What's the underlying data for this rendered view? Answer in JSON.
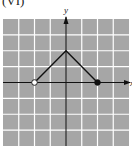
{
  "title": "(VI)",
  "chart_data": {
    "type": "line",
    "title": "(VI)",
    "xlabel": "x",
    "ylabel": "y",
    "xlim": [
      -4,
      4
    ],
    "ylim": [
      -4,
      4
    ],
    "grid": true,
    "grid_step": 1,
    "background_color": "#a6a6a6",
    "grid_color": "#ffffff",
    "line_color": "#111111",
    "series": [
      {
        "name": "f(x)",
        "points": [
          [
            -2,
            0
          ],
          [
            0,
            2
          ],
          [
            2,
            0
          ]
        ],
        "endpoints": [
          {
            "x": -2,
            "y": 0,
            "style": "open"
          },
          {
            "x": 2,
            "y": 0,
            "style": "closed"
          }
        ]
      }
    ]
  },
  "axes": {
    "x_label": "x",
    "y_label": "y"
  }
}
